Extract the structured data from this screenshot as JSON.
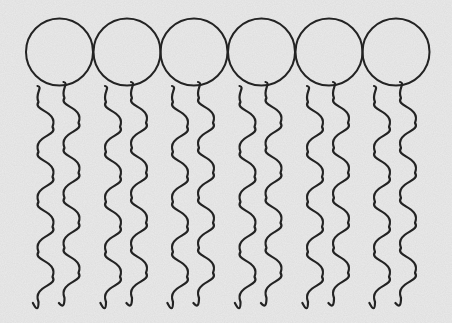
{
  "diagram": {
    "title": "",
    "colors": {
      "background": "#ebebeb",
      "line": "#232323"
    },
    "molecule_count": 6,
    "head": {
      "shape": "circle",
      "radius": 33.5,
      "center_y": 52
    },
    "head_centers_x": [
      59.5,
      127,
      194,
      261.5,
      329,
      396
    ],
    "tail": {
      "shape": "wavy-line",
      "count_per_molecule": 2,
      "start_y": 86,
      "end_y": 303,
      "period": 50,
      "amplitude": 7,
      "left_offset_x": -12,
      "right_offset_x": 14
    },
    "labels": []
  }
}
